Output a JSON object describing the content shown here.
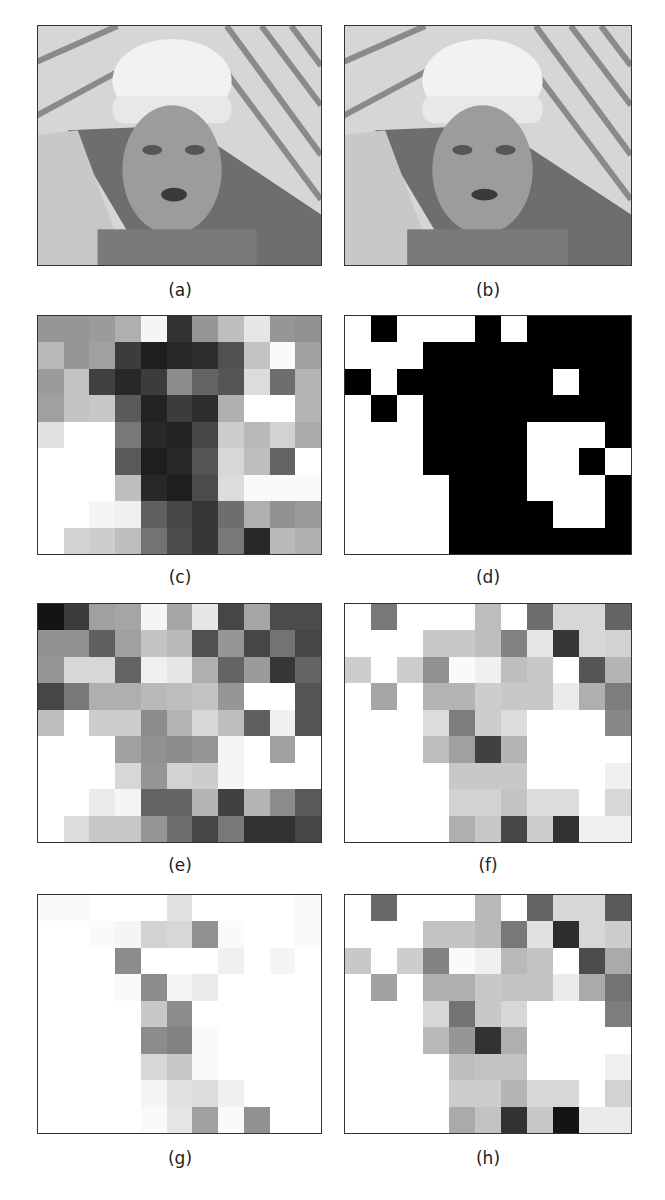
{
  "figure": {
    "panels": [
      {
        "id": "a",
        "label": "(a)",
        "kind": "photo",
        "description": "Original video frame: worker in hard hat"
      },
      {
        "id": "b",
        "label": "(b)",
        "kind": "photo",
        "description": "Second video frame: worker in hard hat"
      },
      {
        "id": "c",
        "label": "(c)",
        "kind": "grid"
      },
      {
        "id": "d",
        "label": "(d)",
        "kind": "grid"
      },
      {
        "id": "e",
        "label": "(e)",
        "kind": "grid"
      },
      {
        "id": "f",
        "label": "(f)",
        "kind": "grid"
      },
      {
        "id": "g",
        "label": "(g)",
        "kind": "grid"
      },
      {
        "id": "h",
        "label": "(h)",
        "kind": "grid"
      }
    ]
  },
  "chart_data": {
    "type": "heatmap",
    "title": "",
    "grid_size": {
      "cols": 11,
      "rows": 9
    },
    "value_range": [
      0,
      255
    ],
    "colormap": "grayscale (0=black, 255=white)",
    "panels": {
      "c": [
        [
          150,
          150,
          155,
          175,
          245,
          50,
          150,
          190,
          230,
          150,
          145
        ],
        [
          185,
          150,
          160,
          60,
          30,
          40,
          45,
          80,
          195,
          250,
          160
        ],
        [
          155,
          195,
          65,
          40,
          60,
          140,
          100,
          85,
          220,
          110,
          180
        ],
        [
          160,
          195,
          200,
          90,
          35,
          60,
          45,
          175,
          255,
          255,
          180
        ],
        [
          225,
          255,
          255,
          120,
          40,
          35,
          70,
          205,
          185,
          210,
          170
        ],
        [
          255,
          255,
          255,
          90,
          30,
          40,
          85,
          215,
          190,
          100,
          255
        ],
        [
          255,
          255,
          255,
          190,
          40,
          30,
          75,
          220,
          250,
          250,
          250
        ],
        [
          255,
          255,
          245,
          240,
          95,
          70,
          55,
          110,
          175,
          145,
          155
        ],
        [
          255,
          210,
          205,
          190,
          115,
          75,
          55,
          120,
          40,
          185,
          175
        ]
      ],
      "d": [
        [
          255,
          0,
          255,
          255,
          255,
          0,
          255,
          0,
          0,
          0,
          0
        ],
        [
          255,
          255,
          255,
          0,
          0,
          0,
          0,
          0,
          0,
          0,
          0
        ],
        [
          0,
          255,
          0,
          0,
          0,
          0,
          0,
          0,
          255,
          0,
          0
        ],
        [
          255,
          0,
          255,
          0,
          0,
          0,
          0,
          0,
          0,
          0,
          0
        ],
        [
          255,
          255,
          255,
          0,
          0,
          0,
          0,
          255,
          255,
          255,
          0
        ],
        [
          255,
          255,
          255,
          0,
          0,
          0,
          0,
          255,
          255,
          0,
          255
        ],
        [
          255,
          255,
          255,
          255,
          0,
          0,
          0,
          255,
          255,
          255,
          0
        ],
        [
          255,
          255,
          255,
          255,
          0,
          0,
          0,
          0,
          255,
          255,
          0
        ],
        [
          255,
          255,
          255,
          255,
          0,
          0,
          0,
          0,
          0,
          0,
          0
        ]
      ],
      "e": [
        [
          20,
          60,
          160,
          165,
          245,
          165,
          230,
          70,
          165,
          75,
          75
        ],
        [
          145,
          145,
          95,
          160,
          195,
          185,
          80,
          150,
          70,
          115,
          70
        ],
        [
          150,
          215,
          215,
          100,
          240,
          230,
          175,
          100,
          155,
          55,
          100
        ],
        [
          70,
          120,
          175,
          175,
          185,
          190,
          195,
          150,
          255,
          255,
          85
        ],
        [
          190,
          255,
          205,
          205,
          140,
          180,
          215,
          190,
          95,
          240,
          85
        ],
        [
          255,
          255,
          255,
          160,
          145,
          140,
          150,
          245,
          255,
          160,
          255
        ],
        [
          255,
          255,
          255,
          215,
          150,
          210,
          205,
          245,
          255,
          255,
          255
        ],
        [
          255,
          255,
          235,
          245,
          100,
          100,
          180,
          65,
          180,
          140,
          90
        ],
        [
          255,
          220,
          200,
          200,
          150,
          110,
          70,
          120,
          50,
          50,
          70
        ]
      ],
      "f": [
        [
          255,
          120,
          255,
          255,
          255,
          190,
          255,
          110,
          215,
          215,
          100
        ],
        [
          255,
          255,
          255,
          200,
          200,
          190,
          130,
          230,
          55,
          215,
          210
        ],
        [
          205,
          255,
          205,
          145,
          250,
          240,
          190,
          200,
          255,
          85,
          180
        ],
        [
          255,
          165,
          255,
          180,
          180,
          205,
          200,
          200,
          235,
          175,
          125
        ],
        [
          255,
          255,
          255,
          220,
          125,
          205,
          220,
          255,
          255,
          255,
          135
        ],
        [
          255,
          255,
          255,
          190,
          160,
          65,
          180,
          255,
          255,
          255,
          255
        ],
        [
          255,
          255,
          255,
          255,
          200,
          200,
          200,
          255,
          255,
          255,
          240
        ],
        [
          255,
          255,
          255,
          255,
          210,
          210,
          195,
          220,
          220,
          255,
          215
        ],
        [
          255,
          255,
          255,
          255,
          175,
          200,
          70,
          205,
          50,
          240,
          240
        ]
      ],
      "g": [
        [
          250,
          250,
          255,
          255,
          255,
          225,
          255,
          255,
          255,
          255,
          250
        ],
        [
          255,
          255,
          250,
          245,
          210,
          215,
          145,
          250,
          255,
          255,
          250
        ],
        [
          255,
          255,
          255,
          140,
          255,
          255,
          255,
          240,
          255,
          245,
          255
        ],
        [
          255,
          255,
          255,
          250,
          140,
          245,
          235,
          255,
          255,
          255,
          255
        ],
        [
          255,
          255,
          255,
          255,
          200,
          140,
          255,
          255,
          255,
          255,
          255
        ],
        [
          255,
          255,
          255,
          255,
          140,
          130,
          250,
          255,
          255,
          255,
          255
        ],
        [
          255,
          255,
          255,
          255,
          215,
          200,
          250,
          255,
          255,
          255,
          255
        ],
        [
          255,
          255,
          255,
          255,
          245,
          225,
          220,
          240,
          255,
          255,
          255
        ],
        [
          255,
          255,
          255,
          255,
          250,
          230,
          160,
          250,
          145,
          255,
          255
        ]
      ],
      "h": [
        [
          255,
          105,
          255,
          255,
          255,
          185,
          255,
          100,
          215,
          215,
          90
        ],
        [
          255,
          255,
          255,
          195,
          195,
          185,
          120,
          225,
          45,
          215,
          205
        ],
        [
          200,
          255,
          205,
          130,
          250,
          240,
          185,
          195,
          255,
          75,
          170
        ],
        [
          255,
          160,
          255,
          175,
          175,
          200,
          195,
          195,
          235,
          170,
          115
        ],
        [
          255,
          255,
          255,
          215,
          115,
          200,
          215,
          255,
          255,
          255,
          125
        ],
        [
          255,
          255,
          255,
          185,
          150,
          50,
          175,
          255,
          255,
          255,
          255
        ],
        [
          255,
          255,
          255,
          255,
          190,
          195,
          195,
          255,
          255,
          255,
          240
        ],
        [
          255,
          255,
          255,
          255,
          205,
          205,
          180,
          215,
          215,
          255,
          210
        ],
        [
          255,
          255,
          255,
          255,
          170,
          195,
          50,
          200,
          20,
          235,
          235
        ]
      ]
    }
  }
}
